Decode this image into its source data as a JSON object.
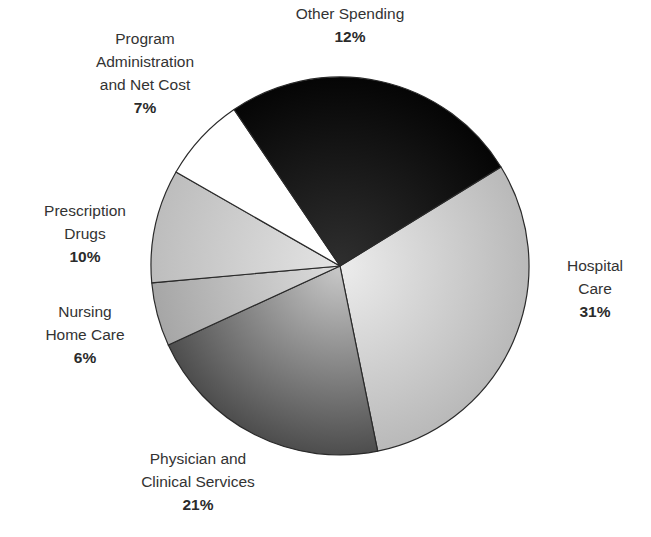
{
  "chart_data": {
    "type": "pie",
    "title": "",
    "slices": [
      {
        "label": "Hospital Care",
        "value": 31,
        "display": "31%",
        "start_deg": -31.6,
        "end_deg": 78.5,
        "color_inner": "#ececec",
        "color_outer": "#b9b9b9"
      },
      {
        "label": "Physician and Clinical Services",
        "value": 21,
        "display": "21%",
        "start_deg": 78.5,
        "end_deg": 155.3,
        "color_inner": "#c9c9c9",
        "color_outer": "#4d4d4d"
      },
      {
        "label": "Nursing Home Care",
        "value": 6,
        "display": "6%",
        "start_deg": 155.3,
        "end_deg": 174.9,
        "color_inner": "#dddddd",
        "color_outer": "#a6a6a6"
      },
      {
        "label": "Prescription Drugs",
        "value": 10,
        "display": "10%",
        "start_deg": 174.9,
        "end_deg": 209.8,
        "color_inner": "#e4e4e4",
        "color_outer": "#bdbdbd"
      },
      {
        "label": "Program Administration and Net Cost",
        "value": 7,
        "display": "7%",
        "start_deg": 209.8,
        "end_deg": 235.9,
        "color_inner": "#ffffff",
        "color_outer": "#ffffff"
      },
      {
        "label": "Other Spending",
        "value": 12,
        "display": "12%",
        "start_deg": 235.9,
        "end_deg": 328.4,
        "color_inner": "#2f2f2f",
        "color_outer": "#050505"
      }
    ],
    "center": [
      340,
      266
    ],
    "radius": 189,
    "legend": "none (direct labels)"
  },
  "labels": {
    "other": {
      "name": "Other Spending",
      "pct": "12%"
    },
    "program": {
      "name": "Program\nAdministration\nand Net Cost",
      "pct": "7%"
    },
    "prescription": {
      "name": "Prescription\nDrugs",
      "pct": "10%"
    },
    "nursing": {
      "name": "Nursing\nHome Care",
      "pct": "6%"
    },
    "physician": {
      "name": "Physician and\nClinical Services",
      "pct": "21%"
    },
    "hospital": {
      "name": "Hospital\nCare",
      "pct": "31%"
    }
  }
}
